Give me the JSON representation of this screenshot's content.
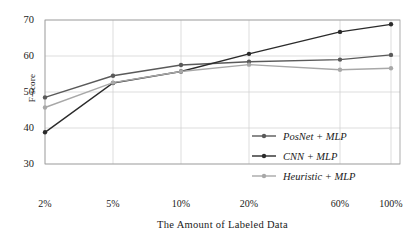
{
  "chart_data": {
    "type": "line",
    "title": "",
    "xlabel": "The Amount of Labeled Data",
    "ylabel": "F-score",
    "categories": [
      "2%",
      "5%",
      "10%",
      "20%",
      "60%",
      "100%"
    ],
    "ylim": [
      30,
      70
    ],
    "yticks": [
      30,
      40,
      50,
      60,
      70
    ],
    "grid": true,
    "legend_position": "center-right",
    "series": [
      {
        "name": "PosNet + MLP",
        "color": "#5a5a5a",
        "values": [
          48.5,
          54.5,
          57.5,
          58.4,
          59.0,
          60.3
        ]
      },
      {
        "name": "CNN + MLP",
        "color": "#2b2b2b",
        "values": [
          38.8,
          52.5,
          55.7,
          60.6,
          66.7,
          68.8
        ]
      },
      {
        "name": "Heuristic + MLP",
        "color": "#a8a8a8",
        "values": [
          45.7,
          52.6,
          55.7,
          57.6,
          56.2,
          56.6
        ]
      }
    ]
  },
  "axis": {
    "ytick_labels": [
      "70",
      "60",
      "50",
      "40",
      "30"
    ],
    "xtick_labels": [
      "2%",
      "5%",
      "10%",
      "20%",
      "60%",
      "100%"
    ],
    "ylabel_text": "F-score",
    "xlabel_text": "The Amount of Labeled Data"
  },
  "legend": {
    "items": [
      {
        "label": "PosNet + MLP"
      },
      {
        "label": "CNN + MLP"
      },
      {
        "label": "Heuristic + MLP"
      }
    ]
  }
}
